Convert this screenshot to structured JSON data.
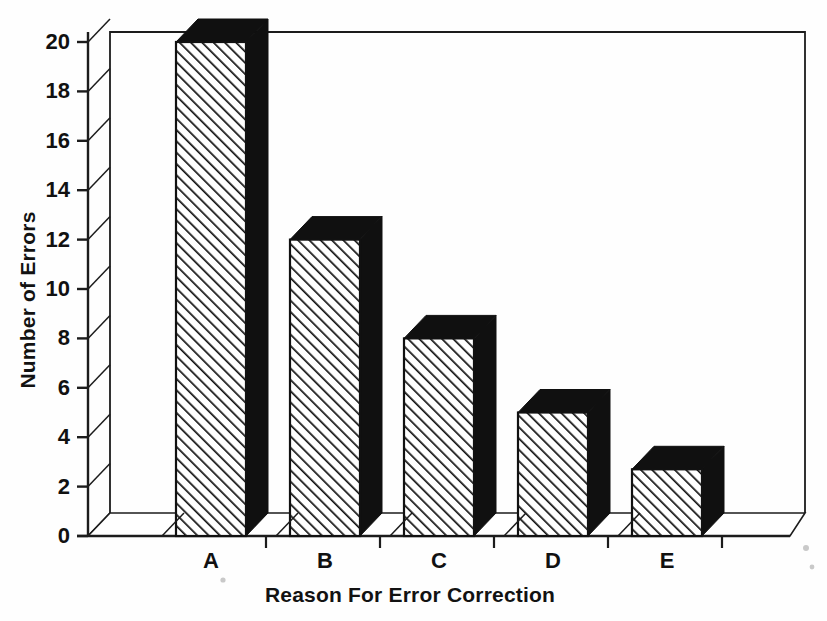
{
  "chart_data": {
    "type": "bar",
    "title": "",
    "subtitle": "",
    "xlabel": "Reason For Error Correction",
    "ylabel": "Number of Errors",
    "categories": [
      "A",
      "B",
      "C",
      "D",
      "E"
    ],
    "values": [
      20,
      12,
      8,
      5,
      2.7
    ],
    "series": [
      {
        "name": "Number of Errors",
        "values": [
          20,
          12,
          8,
          5,
          2.7
        ]
      }
    ],
    "ylim": [
      0,
      20
    ],
    "y_ticks": [
      0,
      2,
      4,
      6,
      8,
      10,
      12,
      14,
      16,
      18,
      20
    ],
    "y_tick_labels": [
      "0",
      "2",
      "4",
      "6",
      "8",
      "10",
      "12",
      "14",
      "16",
      "18",
      "20"
    ],
    "grid": false,
    "legend": "none",
    "style": "3d-hatched-bars",
    "colors": {
      "bar_face": "#ffffff",
      "bar_hatch": "#111111",
      "bar_shadow": "#101010",
      "axis": "#1c1c1c",
      "text": "#111111",
      "background": "#fefefe"
    }
  },
  "axes": {
    "y_title": "Number of Errors",
    "x_title": "Reason For Error Correction"
  },
  "y_ticks": [
    {
      "label": "20",
      "value": 20
    },
    {
      "label": "18",
      "value": 18
    },
    {
      "label": "16",
      "value": 16
    },
    {
      "label": "14",
      "value": 14
    },
    {
      "label": "12",
      "value": 12
    },
    {
      "label": "10",
      "value": 10
    },
    {
      "label": "8",
      "value": 8
    },
    {
      "label": "6",
      "value": 6
    },
    {
      "label": "4",
      "value": 4
    },
    {
      "label": "2",
      "value": 2
    },
    {
      "label": "0",
      "value": 0
    }
  ],
  "x_ticks": [
    {
      "label": "A",
      "value": 20
    },
    {
      "label": "B",
      "value": 12
    },
    {
      "label": "C",
      "value": 8
    },
    {
      "label": "D",
      "value": 5
    },
    {
      "label": "E",
      "value": 2.7
    }
  ]
}
